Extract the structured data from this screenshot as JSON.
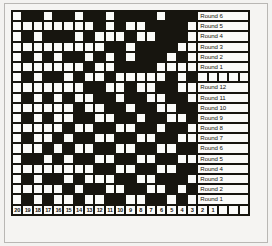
{
  "chart_data": {
    "type": "heatmap",
    "title": "",
    "columns": 23,
    "rows": 20,
    "legend": {
      "dark": "#17150f",
      "light": "#fbfbf9"
    },
    "row_labels_top": [
      "Round 6",
      "Round 5",
      "Round 4",
      "Round 3",
      "Round 2",
      "Round 1"
    ],
    "row_labels_bottom": [
      "Round 12",
      "Round 11",
      "Round 10",
      "Round 9",
      "Round 8",
      "Round 7",
      "Round 6",
      "Round 5",
      "Round 4",
      "Round 3",
      "Round 2",
      "Round 1"
    ],
    "column_numbers": [
      "20",
      "19",
      "18",
      "17",
      "16",
      "15",
      "14",
      "13",
      "12",
      "11",
      "10",
      "9",
      "8",
      "7",
      "6",
      "5",
      "4",
      "3",
      "2",
      "1"
    ],
    "column_trailing_blanks": 3,
    "grid": [
      [
        0,
        1,
        1,
        0,
        1,
        1,
        0,
        1,
        1,
        0,
        1,
        1,
        1,
        1,
        0,
        1,
        1,
        1,
        0,
        1,
        0,
        1,
        0
      ],
      [
        0,
        0,
        0,
        0,
        0,
        0,
        0,
        0,
        1,
        0,
        1,
        0,
        0,
        1,
        1,
        1,
        1,
        0,
        0,
        0,
        1,
        0,
        0
      ],
      [
        0,
        1,
        0,
        1,
        1,
        1,
        0,
        1,
        0,
        0,
        0,
        1,
        0,
        0,
        1,
        1,
        1,
        0,
        1,
        0,
        1,
        1,
        0
      ],
      [
        0,
        0,
        0,
        0,
        0,
        0,
        0,
        0,
        0,
        1,
        1,
        0,
        1,
        1,
        1,
        1,
        0,
        0,
        0,
        0,
        1,
        0,
        0
      ],
      [
        0,
        1,
        0,
        1,
        0,
        1,
        1,
        0,
        1,
        0,
        1,
        0,
        1,
        1,
        1,
        0,
        1,
        0,
        1,
        1,
        0,
        1,
        0
      ],
      [
        0,
        0,
        0,
        0,
        0,
        0,
        0,
        1,
        0,
        0,
        1,
        1,
        1,
        1,
        0,
        0,
        0,
        0,
        0,
        0,
        0,
        0,
        0
      ],
      [
        0,
        1,
        0,
        1,
        1,
        0,
        1,
        0,
        0,
        1,
        0,
        0,
        0,
        0,
        0,
        1,
        0,
        1,
        0,
        1,
        0,
        1,
        0
      ],
      [
        0,
        0,
        0,
        0,
        0,
        0,
        0,
        1,
        1,
        0,
        0,
        1,
        0,
        0,
        1,
        1,
        0,
        0,
        0,
        1,
        1,
        0,
        0
      ],
      [
        0,
        1,
        0,
        1,
        0,
        1,
        0,
        0,
        1,
        1,
        0,
        1,
        1,
        0,
        0,
        1,
        1,
        0,
        1,
        0,
        0,
        1,
        0
      ],
      [
        0,
        0,
        0,
        0,
        0,
        0,
        1,
        0,
        0,
        1,
        1,
        0,
        1,
        1,
        0,
        0,
        1,
        1,
        0,
        0,
        1,
        0,
        0
      ],
      [
        0,
        1,
        0,
        1,
        0,
        0,
        1,
        1,
        0,
        0,
        1,
        1,
        0,
        1,
        1,
        0,
        0,
        1,
        1,
        0,
        0,
        1,
        0
      ],
      [
        0,
        0,
        0,
        0,
        0,
        1,
        0,
        0,
        1,
        1,
        0,
        0,
        1,
        1,
        0,
        1,
        1,
        0,
        0,
        1,
        1,
        0,
        0
      ],
      [
        0,
        1,
        0,
        0,
        1,
        0,
        1,
        1,
        0,
        0,
        1,
        1,
        0,
        0,
        1,
        1,
        0,
        0,
        1,
        0,
        0,
        1,
        0
      ],
      [
        0,
        0,
        0,
        1,
        0,
        1,
        0,
        0,
        1,
        1,
        0,
        0,
        1,
        1,
        0,
        0,
        1,
        1,
        0,
        1,
        1,
        0,
        0
      ],
      [
        0,
        1,
        1,
        0,
        1,
        0,
        1,
        1,
        0,
        0,
        1,
        1,
        0,
        0,
        1,
        1,
        0,
        0,
        1,
        0,
        0,
        1,
        0
      ],
      [
        0,
        0,
        0,
        0,
        0,
        0,
        0,
        0,
        1,
        1,
        0,
        0,
        1,
        1,
        0,
        0,
        1,
        1,
        1,
        1,
        1,
        0,
        0
      ],
      [
        0,
        1,
        0,
        1,
        1,
        0,
        1,
        0,
        0,
        0,
        1,
        1,
        0,
        0,
        1,
        1,
        1,
        0,
        0,
        0,
        0,
        1,
        0
      ],
      [
        0,
        0,
        0,
        0,
        0,
        1,
        0,
        1,
        1,
        0,
        0,
        1,
        1,
        0,
        0,
        1,
        0,
        1,
        1,
        1,
        1,
        0,
        0
      ],
      [
        0,
        1,
        0,
        1,
        0,
        0,
        1,
        0,
        0,
        1,
        1,
        0,
        0,
        1,
        1,
        0,
        1,
        0,
        0,
        0,
        0,
        1,
        0
      ],
      [
        0,
        0,
        0,
        0,
        0,
        0,
        0,
        0,
        0,
        0,
        0,
        1,
        1,
        0,
        0,
        1,
        1,
        1,
        1,
        1,
        1,
        0,
        0
      ]
    ]
  }
}
